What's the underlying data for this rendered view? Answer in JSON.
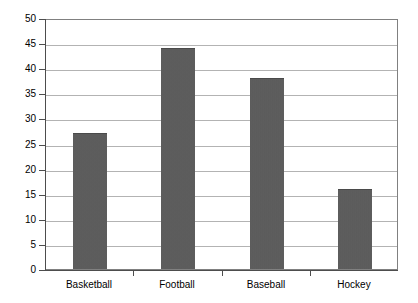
{
  "chart_data": {
    "type": "bar",
    "title": "",
    "subtitle": "",
    "xlabel": "",
    "ylabel": "",
    "categories": [
      "Basketball",
      "Football",
      "Baseball",
      "Hockey"
    ],
    "values": [
      27,
      44,
      38,
      16
    ],
    "ylim": [
      0,
      50
    ],
    "ytick_step": 5,
    "yticks": [
      0,
      5,
      10,
      15,
      20,
      25,
      30,
      35,
      40,
      45,
      50
    ],
    "ytick_labels": [
      "0",
      "5",
      "10",
      "15",
      "20",
      "25",
      "30",
      "35",
      "40",
      "45",
      "50"
    ],
    "grid": true,
    "grid_axis": "y",
    "legend": false,
    "legend_position": "none",
    "series": [
      {
        "name": "",
        "values": [
          27,
          44,
          38,
          16
        ]
      }
    ],
    "colors": {
      "bar_fill": "#5a5a5a",
      "grid": "#b3b3b3",
      "axis": "#4d4d4d",
      "plot_border": "#808080",
      "background": "#ffffff",
      "text": "#000000"
    }
  }
}
